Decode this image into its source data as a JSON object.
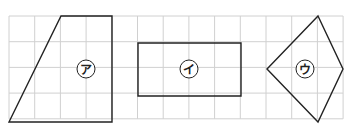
{
  "grid": {
    "x0": 9,
    "y0": 16,
    "cell": 25.7,
    "cols": 13,
    "rows": 4,
    "line_color": "#d0d0d0"
  },
  "shapes": [
    {
      "id": "a",
      "label": "ア",
      "type": "trapezoid",
      "points": "61,16 112,16 112,122 9,122",
      "cx": 86,
      "cy": 69
    },
    {
      "id": "i",
      "label": "イ",
      "type": "rectangle",
      "points": "138,43 241,43 241,96 138,96",
      "cx": 189,
      "cy": 69
    },
    {
      "id": "u",
      "label": "ウ",
      "type": "kite",
      "points": "318,16 343,69 318,122 267,69",
      "cx": 305,
      "cy": 69
    }
  ],
  "colors": {
    "shape_stroke": "#222222",
    "grid": "#d0d0d0"
  }
}
